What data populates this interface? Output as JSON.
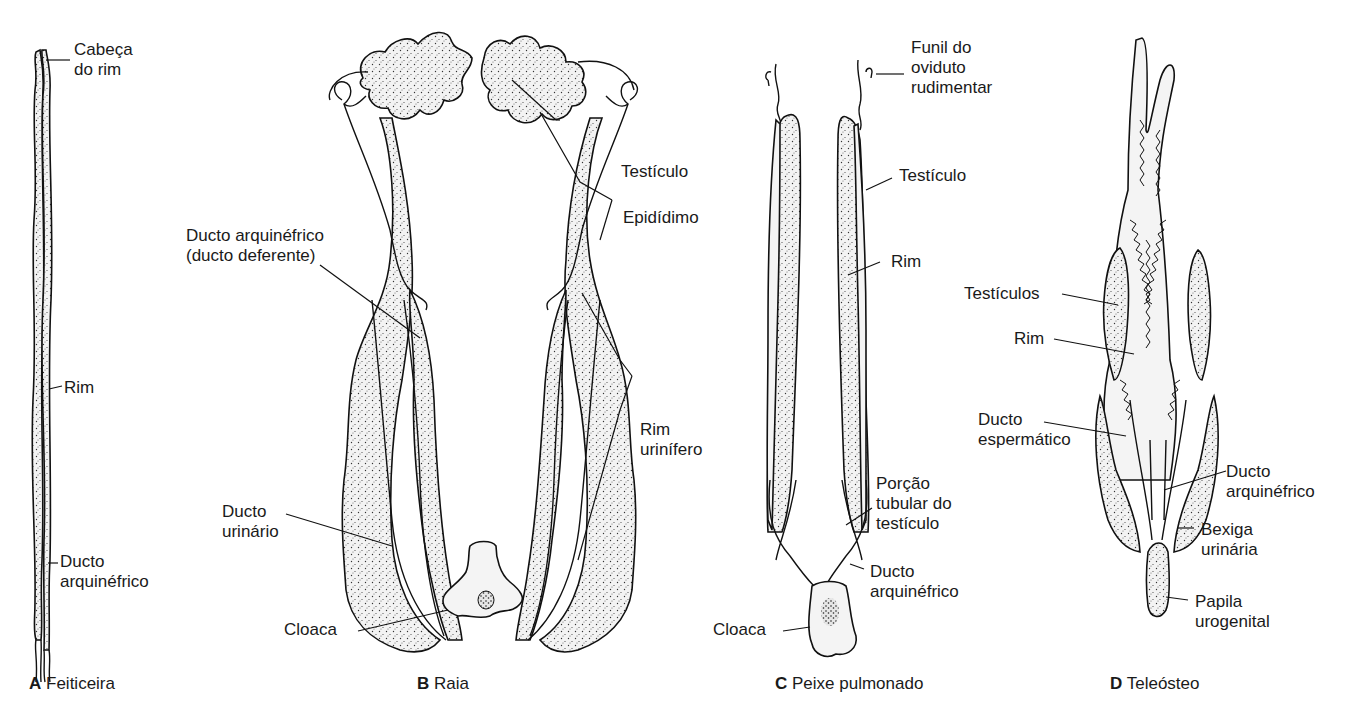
{
  "figure": {
    "panels": [
      {
        "id": "A",
        "letter": "A",
        "name": "Feiticeira",
        "labels": [
          {
            "key": "cabeca",
            "lines": [
              "Cabeça",
              "do rim"
            ]
          },
          {
            "key": "rim",
            "lines": [
              "Rim"
            ]
          },
          {
            "key": "ducto",
            "lines": [
              "Ducto",
              "arquinéfrico"
            ]
          }
        ]
      },
      {
        "id": "B",
        "letter": "B",
        "name": "Raia",
        "labels": [
          {
            "key": "ducto-arq",
            "lines": [
              "Ducto arquinéfrico",
              "(ducto deferente)"
            ]
          },
          {
            "key": "testiculo",
            "lines": [
              "Testículo"
            ]
          },
          {
            "key": "epididimo",
            "lines": [
              "Epidídimo"
            ]
          },
          {
            "key": "rim-urinifero",
            "lines": [
              "Rim",
              "urinífero"
            ]
          },
          {
            "key": "ducto-urinario",
            "lines": [
              "Ducto",
              "urinário"
            ]
          },
          {
            "key": "cloaca",
            "lines": [
              "Cloaca"
            ]
          }
        ]
      },
      {
        "id": "C",
        "letter": "C",
        "name": "Peixe pulmonado",
        "labels": [
          {
            "key": "funil",
            "lines": [
              "Funil do",
              "oviduto",
              "rudimentar"
            ]
          },
          {
            "key": "testiculo",
            "lines": [
              "Testículo"
            ]
          },
          {
            "key": "rim",
            "lines": [
              "Rim"
            ]
          },
          {
            "key": "porcao",
            "lines": [
              "Porção",
              "tubular do",
              "testículo"
            ]
          },
          {
            "key": "ducto",
            "lines": [
              "Ducto",
              "arquinéfrico"
            ]
          },
          {
            "key": "cloaca",
            "lines": [
              "Cloaca"
            ]
          }
        ]
      },
      {
        "id": "D",
        "letter": "D",
        "name": "Teleósteo",
        "labels": [
          {
            "key": "testiculos",
            "lines": [
              "Testículos"
            ]
          },
          {
            "key": "rim",
            "lines": [
              "Rim"
            ]
          },
          {
            "key": "ducto-esp",
            "lines": [
              "Ducto",
              "espermático"
            ]
          },
          {
            "key": "ducto-arq",
            "lines": [
              "Ducto",
              "arquinéfrico"
            ]
          },
          {
            "key": "bexiga",
            "lines": [
              "Bexiga",
              "urinária"
            ]
          },
          {
            "key": "papila",
            "lines": [
              "Papila",
              "urogenital"
            ]
          }
        ]
      }
    ]
  }
}
